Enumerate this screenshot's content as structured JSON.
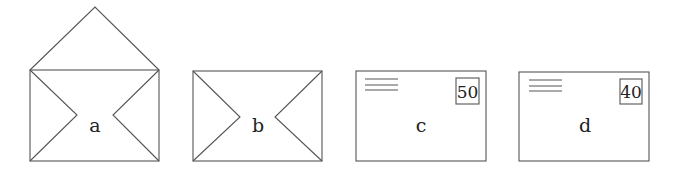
{
  "figure": {
    "envelopes": [
      {
        "label": "a",
        "state": "open flap"
      },
      {
        "label": "b",
        "state": "back, closed"
      },
      {
        "label": "c",
        "state": "front with stamp",
        "stamp_value": "50"
      },
      {
        "label": "d",
        "state": "front with stamp",
        "stamp_value": "40"
      }
    ],
    "colors": {
      "line": "#555555",
      "text": "#222222",
      "background": "#ffffff"
    }
  }
}
